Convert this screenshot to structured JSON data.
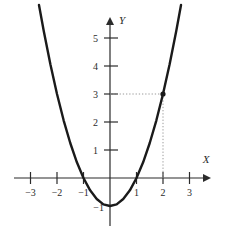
{
  "chart_data": {
    "type": "line",
    "title": "",
    "xlabel": "X",
    "ylabel": "Y",
    "function_label": "y = x^2 - 1",
    "xlim": [
      -3.4,
      3.5
    ],
    "ylim": [
      -1.6,
      6.2
    ],
    "grid": false,
    "legend": null,
    "x_ticks": [
      -3,
      -2,
      -1,
      1,
      2,
      3
    ],
    "x_tick_labels": [
      "−3",
      "−2",
      "−1",
      "1",
      "2",
      "3"
    ],
    "y_ticks": [
      1,
      2,
      3,
      4,
      5
    ],
    "y_tick_labels": [
      "1",
      "2",
      "3",
      "4",
      "5"
    ],
    "negative_y_tick_labels": [
      "−1"
    ],
    "negative_y_ticks": [
      -1
    ],
    "series": [
      {
        "name": "parabola",
        "color": "#1a1a1a",
        "x": [
          -2.68,
          -2.5,
          -2.25,
          -2.0,
          -1.75,
          -1.5,
          -1.25,
          -1.0,
          -0.75,
          -0.5,
          -0.25,
          0,
          0.25,
          0.5,
          0.75,
          1.0,
          1.25,
          1.5,
          1.75,
          2.0,
          2.25,
          2.5,
          2.68
        ],
        "y": [
          6.18,
          5.25,
          4.06,
          3.0,
          2.06,
          1.25,
          0.56,
          0.0,
          -0.44,
          -0.75,
          -0.94,
          -1.0,
          -0.94,
          -0.75,
          -0.44,
          0.0,
          0.56,
          1.25,
          2.06,
          3.0,
          4.06,
          5.25,
          6.18
        ]
      }
    ],
    "marked_points": [
      {
        "name": "point-2-3",
        "x": 2,
        "y": 3,
        "color": "#1a1a1a"
      }
    ],
    "guide_lines": [
      {
        "name": "horizontal-guide-y3",
        "from": [
          0,
          3
        ],
        "to": [
          2,
          3
        ],
        "style": "dotted"
      },
      {
        "name": "vertical-guide-x2",
        "from": [
          2,
          3
        ],
        "to": [
          2,
          0
        ],
        "style": "dotted"
      }
    ],
    "axis_color": "#2b2b2b",
    "curve_color": "#1a1a1a",
    "guide_color": "#9a9a9a"
  }
}
